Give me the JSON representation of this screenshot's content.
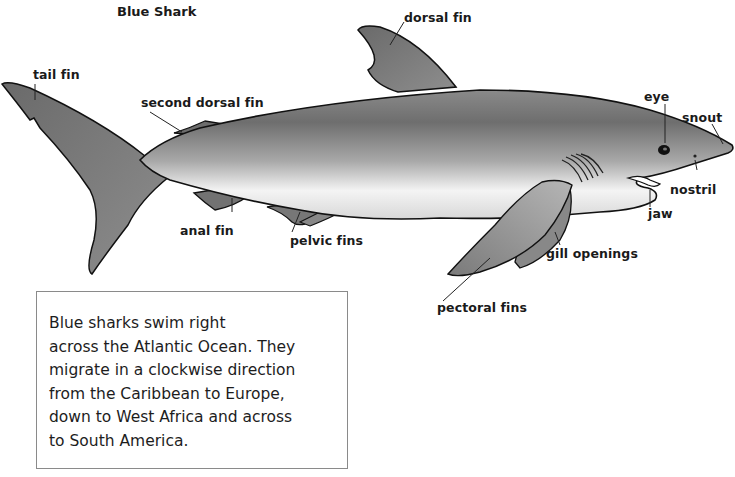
{
  "title": "Blue Shark",
  "labels": {
    "dorsal_fin": "dorsal fin",
    "tail_fin": "tail fin",
    "second_dorsal_fin": "second dorsal fin",
    "eye": "eye",
    "snout": "snout",
    "nostril": "nostril",
    "jaw": "jaw",
    "anal_fin": "anal fin",
    "pelvic_fins": "pelvic fins",
    "gill_openings": "gill openings",
    "pectoral_fins": "pectoral fins"
  },
  "caption": {
    "lines": [
      "Blue sharks swim right",
      "across the Atlantic Ocean. They",
      "migrate in a clockwise direction",
      "from the Caribbean to Europe,",
      "down to West Africa and across",
      "to South America."
    ]
  },
  "colors": {
    "body_dark": "#6f6f6f",
    "body_mid": "#9a9a9a",
    "belly": "#f2f2f2",
    "fin": "#7d7d7d",
    "outline": "#111111"
  }
}
